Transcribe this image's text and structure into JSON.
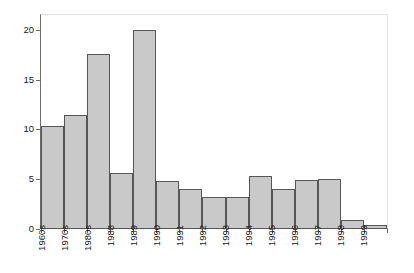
{
  "chart_data": {
    "type": "bar",
    "title": "",
    "xlabel": "",
    "ylabel": "Percent of Respondents",
    "categories": [
      "1960s",
      "1970s",
      "1980s",
      "1988",
      "1989",
      "1990",
      "1991",
      "1992",
      "1993",
      "1994",
      "1995",
      "1996",
      "1997",
      "1998",
      "1999"
    ],
    "values": [
      10.3,
      11.5,
      17.6,
      5.6,
      20.0,
      4.8,
      4.0,
      3.2,
      3.2,
      5.35,
      4.0,
      4.9,
      5.05,
      0.9,
      0.4
    ],
    "ylim": [
      0,
      21.5
    ],
    "yticks": [
      0,
      5,
      10,
      15,
      20
    ],
    "ytick_labels": [
      "0",
      "5",
      "10",
      "15",
      "20"
    ],
    "grid": false,
    "legend": null,
    "bar_fill_color": "#c9c9c9",
    "bar_border_color": "#575757",
    "axis_color": "#6b6b6b",
    "background_color": "#ffffff"
  }
}
